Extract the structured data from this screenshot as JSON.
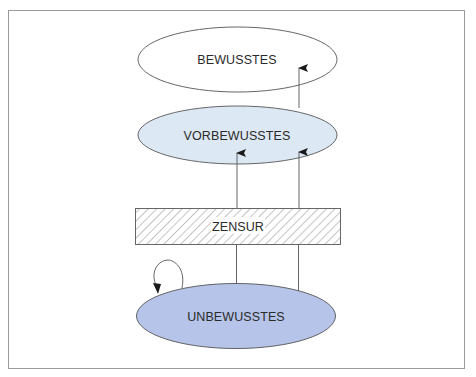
{
  "diagram": {
    "type": "freud-topographic-model",
    "frame": {
      "stroke": "#9a9a9a"
    },
    "nodes": [
      {
        "id": "bewusstes",
        "label": "BEWUSSTES",
        "shape": "ellipse",
        "fill": "#ffffff"
      },
      {
        "id": "vorbewusstes",
        "label": "VORBEWUSSTES",
        "shape": "ellipse",
        "fill": "#dde8f5"
      },
      {
        "id": "zensur",
        "label": "ZENSUR",
        "shape": "hatched-rectangle",
        "fill": "#ffffff"
      },
      {
        "id": "unbewusstes",
        "label": "UNBEWUSSTES",
        "shape": "ellipse",
        "fill": "#b5c4e8"
      }
    ],
    "edges": [
      {
        "from": "unbewusstes",
        "to": "zensur",
        "arrow": false,
        "note": "left line"
      },
      {
        "from": "unbewusstes",
        "to": "zensur",
        "arrow": false,
        "note": "right line"
      },
      {
        "from": "zensur",
        "to": "vorbewusstes",
        "arrow": true,
        "note": "left arrow"
      },
      {
        "from": "zensur",
        "to": "vorbewusstes",
        "arrow": true,
        "note": "right arrow"
      },
      {
        "from": "vorbewusstes",
        "to": "bewusstes",
        "arrow": true
      },
      {
        "from": "unbewusstes",
        "to": "unbewusstes",
        "arrow": true,
        "note": "self-loop"
      }
    ],
    "colors": {
      "stroke": "#555555",
      "arrow": "#1a1a1a",
      "hatch": "#8a8a8a"
    }
  }
}
